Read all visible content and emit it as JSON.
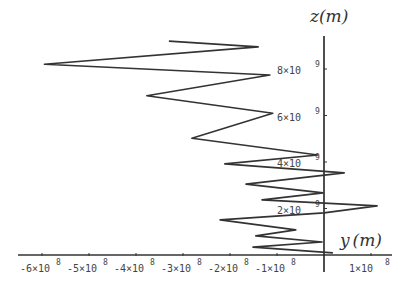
{
  "chart_data": {
    "type": "line",
    "title": "",
    "xlabel": "y (m)",
    "ylabel": "z (m)",
    "xlim": [
      -630000000.0,
      150000000.0
    ],
    "ylim": [
      0,
      9500000000.0
    ],
    "grid": false,
    "legend": null,
    "x_ticks": [
      {
        "value": -600000000.0,
        "label": "-6×10",
        "exp": "8"
      },
      {
        "value": -500000000.0,
        "label": "-5×10",
        "exp": "8"
      },
      {
        "value": -400000000.0,
        "label": "-4×10",
        "exp": "8"
      },
      {
        "value": -300000000.0,
        "label": "-3×10",
        "exp": "8"
      },
      {
        "value": -200000000.0,
        "label": "-2×10",
        "exp": "8"
      },
      {
        "value": -100000000.0,
        "label": "-1×10",
        "exp": "8"
      },
      {
        "value": 100000000.0,
        "label": "1×10",
        "exp": "8"
      }
    ],
    "y_ticks": [
      {
        "value": 2000000000.0,
        "label": "2×10",
        "exp": "9"
      },
      {
        "value": 4000000000.0,
        "label": "4×10",
        "exp": "9"
      },
      {
        "value": 6000000000.0,
        "label": "6×10",
        "exp": "9"
      },
      {
        "value": 8000000000.0,
        "label": "8×10",
        "exp": "9"
      }
    ],
    "series": [
      {
        "name": "trajectory",
        "color": "#333333",
        "points": [
          [
            -330000000.0,
            9200000000.0
          ],
          [
            -140000000.0,
            8950000000.0
          ],
          [
            -595000000.0,
            8200000000.0
          ],
          [
            -115000000.0,
            7740000000.0
          ],
          [
            -377000000.0,
            6850000000.0
          ],
          [
            -109000000.0,
            6100000000.0
          ],
          [
            -281000000.0,
            5020000000.0
          ],
          [
            -13000000.0,
            4300000000.0
          ],
          [
            -211000000.0,
            3920000000.0
          ],
          [
            43000000.0,
            3530000000.0
          ],
          [
            -166000000.0,
            3050000000.0
          ],
          [
            -2000000.0,
            2670000000.0
          ],
          [
            -132000000.0,
            2370000000.0
          ],
          [
            113000000.0,
            2110000000.0
          ],
          [
            0.0,
            1810000000.0
          ],
          [
            -221000000.0,
            1510000000.0
          ],
          [
            -60000000.0,
            1080000000.0
          ],
          [
            -145000000.0,
            820000000.0
          ],
          [
            -4000000.0,
            560000000.0
          ],
          [
            -151000000.0,
            340000000.0
          ],
          [
            19000000.0,
            90000000.0
          ]
        ]
      }
    ]
  },
  "labels": {
    "x_axis_title_var": "y",
    "x_axis_title_unit": "(m)",
    "y_axis_title_var": "z",
    "y_axis_title_unit": "(m)"
  }
}
